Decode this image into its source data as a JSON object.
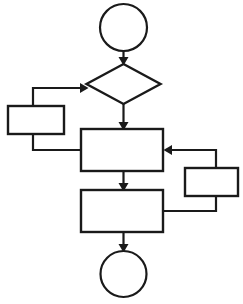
{
  "diagram": {
    "type": "flowchart",
    "background_color": "#ffffff",
    "stroke_color": "#1a1a1a",
    "fill_color": "#ffffff",
    "width": 243,
    "height": 304,
    "nodes": [
      {
        "id": "start",
        "name": "start-terminator",
        "shape": "circle",
        "label": "",
        "cx": 123.5,
        "cy": 27.5,
        "r": 23.5
      },
      {
        "id": "decision",
        "name": "decision-diamond",
        "shape": "diamond",
        "label": "",
        "cx": 123.5,
        "cy": 84,
        "half_width": 37,
        "half_height": 20
      },
      {
        "id": "left_process",
        "name": "left-process-box",
        "shape": "rectangle",
        "label": "",
        "x": 8,
        "y": 106,
        "width": 56,
        "height": 28
      },
      {
        "id": "center_process",
        "name": "center-process-box",
        "shape": "rectangle",
        "label": "",
        "x": 81,
        "y": 129,
        "width": 82,
        "height": 42
      },
      {
        "id": "right_process",
        "name": "right-process-box",
        "shape": "rectangle",
        "label": "",
        "x": 185,
        "y": 168,
        "width": 53,
        "height": 28
      },
      {
        "id": "lower_process",
        "name": "lower-process-box",
        "shape": "rectangle",
        "label": "",
        "x": 81,
        "y": 190,
        "width": 82,
        "height": 42
      },
      {
        "id": "end",
        "name": "end-terminator",
        "shape": "circle",
        "label": "",
        "cx": 123.5,
        "cy": 274,
        "r": 23
      }
    ],
    "connectors": [
      {
        "id": "start_to_decision",
        "name": "connector-start-to-decision",
        "from": "start",
        "to": "decision",
        "label": "",
        "path": "M 123.5 51 L 123.5 62",
        "arrow": {
          "x": 123.5,
          "y": 64,
          "dir": "down"
        }
      },
      {
        "id": "decision_to_center",
        "name": "connector-decision-to-center",
        "from": "decision",
        "to": "center_process",
        "label": "",
        "path": "M 123.5 104 L 123.5 127",
        "arrow": {
          "x": 123.5,
          "y": 129,
          "dir": "down"
        }
      },
      {
        "id": "left_to_decision",
        "name": "connector-left-to-decision",
        "from": "left_process",
        "to": "decision",
        "label": "",
        "path": "M 33 106 L 33 88 L 85 88",
        "arrow": {
          "x": 87,
          "y": 88,
          "dir": "right"
        }
      },
      {
        "id": "left_to_center",
        "name": "connector-left-to-center",
        "from": "left_process",
        "to": "center_process",
        "label": "",
        "path": "M 33 134 L 33 150 L 81 150",
        "arrow": null
      },
      {
        "id": "center_to_lower",
        "name": "connector-center-to-lower",
        "from": "center_process",
        "to": "lower_process",
        "label": "",
        "path": "M 123.5 171 L 123.5 188",
        "arrow": {
          "x": 123.5,
          "y": 190,
          "dir": "down"
        }
      },
      {
        "id": "right_to_center",
        "name": "connector-right-to-center",
        "from": "right_process",
        "to": "center_process",
        "label": "",
        "path": "M 216 168 L 216 150 L 167 150",
        "arrow": {
          "x": 165,
          "y": 150,
          "dir": "left"
        }
      },
      {
        "id": "lower_to_right",
        "name": "connector-lower-to-right",
        "from": "lower_process",
        "to": "right_process",
        "label": "",
        "path": "M 163 211 L 216 211 L 216 196",
        "arrow": null
      },
      {
        "id": "lower_to_end",
        "name": "connector-lower-to-end",
        "from": "lower_process",
        "to": "end",
        "label": "",
        "path": "M 123.5 232 L 123.5 249",
        "arrow": {
          "x": 123.5,
          "y": 251,
          "dir": "down"
        }
      }
    ]
  }
}
